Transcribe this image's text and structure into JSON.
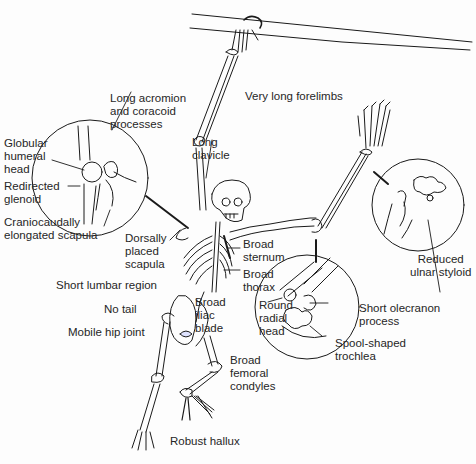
{
  "diagram": {
    "colors": {
      "ink": "#262626",
      "line": "#1a1a1a",
      "background": "#fdfdfd"
    },
    "labels": {
      "forelimbs": "Very long forelimbs",
      "acromion": "Long acromion\nand coracoid\nprocesses",
      "humeral_head": "Globular\nhumeral\nhead",
      "glenoid": "Redirected\nglenoid",
      "scapula_elongated": "Craniocaudally\nelongated scapula",
      "clavicle": "Long\nclavicle",
      "dorsal_scapula": "Dorsally\nplaced\nscapula",
      "sternum": "Broad\nsternum",
      "thorax": "Broad\nthorax",
      "lumbar": "Short lumbar region",
      "tail": "No tail",
      "hip": "Mobile hip joint",
      "iliac": "Broad\niliac\nblade",
      "femoral": "Broad\nfemoral\ncondyles",
      "hallux": "Robust hallux",
      "radial_head": "Round\nradial\nhead",
      "olecranon": "Short olecranon\nprocess",
      "trochlea": "Spool-shaped\ntrochlea",
      "ulnar_styloid": "Reduced\nulnar styloid"
    },
    "insets": [
      {
        "name": "shoulder-inset",
        "cx": 90,
        "cy": 178,
        "r": 58
      },
      {
        "name": "elbow-inset",
        "cx": 307,
        "cy": 307,
        "r": 52
      },
      {
        "name": "wrist-inset",
        "cx": 418,
        "cy": 205,
        "r": 46
      }
    ]
  }
}
